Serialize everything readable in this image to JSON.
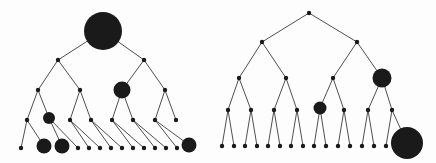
{
  "figure": {
    "type": "diagram",
    "background_color": "#fdfdfd",
    "node_color": "#1a1a1a",
    "edge_color": "#3b3b3b",
    "edge_width": 0.9,
    "width": 436,
    "height": 163
  },
  "trees": [
    {
      "name": "left-tree",
      "label": "",
      "levels": 5,
      "nodes": [
        {
          "id": "L-r",
          "x": 103,
          "y": 31,
          "r": 19.0
        },
        {
          "id": "L-0",
          "x": 58,
          "y": 60,
          "r": 2.2
        },
        {
          "id": "L-1",
          "x": 144,
          "y": 60,
          "r": 2.2
        },
        {
          "id": "L-00",
          "x": 38,
          "y": 90,
          "r": 2.2
        },
        {
          "id": "L-01",
          "x": 80,
          "y": 90,
          "r": 2.2
        },
        {
          "id": "L-10",
          "x": 122,
          "y": 90,
          "r": 8.5
        },
        {
          "id": "L-11",
          "x": 165,
          "y": 90,
          "r": 2.2
        },
        {
          "id": "L-000",
          "x": 27,
          "y": 120,
          "r": 2.2
        },
        {
          "id": "L-001",
          "x": 49,
          "y": 118,
          "r": 6.0
        },
        {
          "id": "L-010",
          "x": 70,
          "y": 120,
          "r": 2.2
        },
        {
          "id": "L-011",
          "x": 91,
          "y": 120,
          "r": 2.2
        },
        {
          "id": "L-100",
          "x": 112,
          "y": 120,
          "r": 2.2
        },
        {
          "id": "L-101",
          "x": 133,
          "y": 120,
          "r": 2.2
        },
        {
          "id": "L-110",
          "x": 155,
          "y": 120,
          "r": 2.2
        },
        {
          "id": "L-111",
          "x": 176,
          "y": 120,
          "r": 2.2
        },
        {
          "id": "L-0000",
          "x": 21,
          "y": 148,
          "r": 2.2
        },
        {
          "id": "L-0001",
          "x": 44,
          "y": 146,
          "r": 7.5
        },
        {
          "id": "L-0010",
          "x": 62,
          "y": 146,
          "r": 7.5
        },
        {
          "id": "L-0011",
          "x": 78,
          "y": 148,
          "r": 2.2
        },
        {
          "id": "L-0100",
          "x": 89,
          "y": 148,
          "r": 2.2
        },
        {
          "id": "L-0101",
          "x": 100,
          "y": 148,
          "r": 2.2
        },
        {
          "id": "L-0110",
          "x": 111,
          "y": 148,
          "r": 2.2
        },
        {
          "id": "L-0111",
          "x": 122,
          "y": 148,
          "r": 2.2
        },
        {
          "id": "L-1000",
          "x": 133,
          "y": 148,
          "r": 2.2
        },
        {
          "id": "L-1001",
          "x": 144,
          "y": 148,
          "r": 2.2
        },
        {
          "id": "L-1010",
          "x": 155,
          "y": 148,
          "r": 2.2
        },
        {
          "id": "L-1011",
          "x": 166,
          "y": 148,
          "r": 2.2
        },
        {
          "id": "L-1100",
          "x": 177,
          "y": 148,
          "r": 2.2
        },
        {
          "id": "L-1101",
          "x": 189,
          "y": 145,
          "r": 7.5
        }
      ],
      "edges": [
        [
          "L-r",
          "L-0"
        ],
        [
          "L-r",
          "L-1"
        ],
        [
          "L-0",
          "L-00"
        ],
        [
          "L-0",
          "L-01"
        ],
        [
          "L-1",
          "L-10"
        ],
        [
          "L-1",
          "L-11"
        ],
        [
          "L-00",
          "L-000"
        ],
        [
          "L-00",
          "L-001"
        ],
        [
          "L-01",
          "L-010"
        ],
        [
          "L-01",
          "L-011"
        ],
        [
          "L-10",
          "L-100"
        ],
        [
          "L-10",
          "L-101"
        ],
        [
          "L-11",
          "L-110"
        ],
        [
          "L-11",
          "L-111"
        ],
        [
          "L-000",
          "L-0000"
        ],
        [
          "L-000",
          "L-0001"
        ],
        [
          "L-001",
          "L-0010"
        ],
        [
          "L-001",
          "L-0011"
        ],
        [
          "L-010",
          "L-0100"
        ],
        [
          "L-010",
          "L-0101"
        ],
        [
          "L-011",
          "L-0110"
        ],
        [
          "L-011",
          "L-0111"
        ],
        [
          "L-100",
          "L-1000"
        ],
        [
          "L-100",
          "L-1001"
        ],
        [
          "L-101",
          "L-1010"
        ],
        [
          "L-101",
          "L-1011"
        ],
        [
          "L-110",
          "L-1100"
        ],
        [
          "L-110",
          "L-1101"
        ]
      ]
    },
    {
      "name": "right-tree",
      "label": "",
      "levels": 5,
      "nodes": [
        {
          "id": "R-r",
          "x": 309,
          "y": 13,
          "r": 2.2
        },
        {
          "id": "R-0",
          "x": 262,
          "y": 42,
          "r": 2.2
        },
        {
          "id": "R-1",
          "x": 357,
          "y": 42,
          "r": 2.2
        },
        {
          "id": "R-00",
          "x": 239,
          "y": 78,
          "r": 2.2
        },
        {
          "id": "R-01",
          "x": 286,
          "y": 78,
          "r": 2.2
        },
        {
          "id": "R-10",
          "x": 333,
          "y": 78,
          "r": 2.2
        },
        {
          "id": "R-11",
          "x": 382,
          "y": 78,
          "r": 9.5
        },
        {
          "id": "R-000",
          "x": 228,
          "y": 110,
          "r": 2.2
        },
        {
          "id": "R-001",
          "x": 251,
          "y": 110,
          "r": 2.2
        },
        {
          "id": "R-010",
          "x": 274,
          "y": 110,
          "r": 2.2
        },
        {
          "id": "R-011",
          "x": 297,
          "y": 110,
          "r": 2.2
        },
        {
          "id": "R-100",
          "x": 320,
          "y": 108,
          "r": 6.5
        },
        {
          "id": "R-101",
          "x": 344,
          "y": 110,
          "r": 2.2
        },
        {
          "id": "R-110",
          "x": 368,
          "y": 110,
          "r": 2.2
        },
        {
          "id": "R-111",
          "x": 392,
          "y": 110,
          "r": 2.2
        },
        {
          "id": "R-0000",
          "x": 222,
          "y": 146,
          "r": 2.2
        },
        {
          "id": "R-0001",
          "x": 234,
          "y": 146,
          "r": 2.2
        },
        {
          "id": "R-0010",
          "x": 245,
          "y": 146,
          "r": 2.2
        },
        {
          "id": "R-0011",
          "x": 257,
          "y": 146,
          "r": 2.2
        },
        {
          "id": "R-0100",
          "x": 268,
          "y": 146,
          "r": 2.2
        },
        {
          "id": "R-0101",
          "x": 280,
          "y": 146,
          "r": 2.2
        },
        {
          "id": "R-0110",
          "x": 291,
          "y": 146,
          "r": 2.2
        },
        {
          "id": "R-0111",
          "x": 303,
          "y": 146,
          "r": 2.2
        },
        {
          "id": "R-1000",
          "x": 314,
          "y": 146,
          "r": 2.2
        },
        {
          "id": "R-1001",
          "x": 326,
          "y": 146,
          "r": 2.2
        },
        {
          "id": "R-1010",
          "x": 338,
          "y": 146,
          "r": 2.2
        },
        {
          "id": "R-1011",
          "x": 350,
          "y": 146,
          "r": 2.2
        },
        {
          "id": "R-1100",
          "x": 362,
          "y": 146,
          "r": 2.2
        },
        {
          "id": "R-1101",
          "x": 374,
          "y": 146,
          "r": 2.2
        },
        {
          "id": "R-1110",
          "x": 386,
          "y": 146,
          "r": 2.2
        },
        {
          "id": "R-1111",
          "x": 407,
          "y": 143,
          "r": 16.0
        }
      ],
      "edges": [
        [
          "R-r",
          "R-0"
        ],
        [
          "R-r",
          "R-1"
        ],
        [
          "R-0",
          "R-00"
        ],
        [
          "R-0",
          "R-01"
        ],
        [
          "R-1",
          "R-10"
        ],
        [
          "R-1",
          "R-11"
        ],
        [
          "R-00",
          "R-000"
        ],
        [
          "R-00",
          "R-001"
        ],
        [
          "R-01",
          "R-010"
        ],
        [
          "R-01",
          "R-011"
        ],
        [
          "R-10",
          "R-100"
        ],
        [
          "R-10",
          "R-101"
        ],
        [
          "R-11",
          "R-110"
        ],
        [
          "R-11",
          "R-111"
        ],
        [
          "R-000",
          "R-0000"
        ],
        [
          "R-000",
          "R-0001"
        ],
        [
          "R-001",
          "R-0010"
        ],
        [
          "R-001",
          "R-0011"
        ],
        [
          "R-010",
          "R-0100"
        ],
        [
          "R-010",
          "R-0101"
        ],
        [
          "R-011",
          "R-0110"
        ],
        [
          "R-011",
          "R-0111"
        ],
        [
          "R-100",
          "R-1000"
        ],
        [
          "R-100",
          "R-1001"
        ],
        [
          "R-101",
          "R-1010"
        ],
        [
          "R-101",
          "R-1011"
        ],
        [
          "R-110",
          "R-1100"
        ],
        [
          "R-110",
          "R-1101"
        ],
        [
          "R-111",
          "R-1110"
        ],
        [
          "R-111",
          "R-1111"
        ]
      ]
    }
  ]
}
